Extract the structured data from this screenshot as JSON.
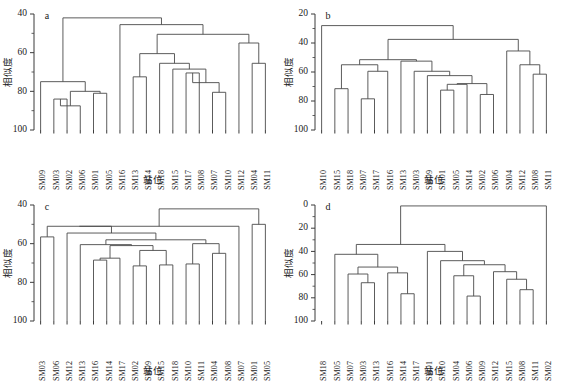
{
  "figure": {
    "width": 561,
    "height": 381,
    "background": "#ffffff",
    "line_color": "#4a4a4a",
    "text_color": "#1a1a1a"
  },
  "axis_titles": {
    "y": "相似度",
    "x": "站位"
  },
  "panels": [
    {
      "tag": "a",
      "y_ticks": [
        40,
        60,
        80,
        100
      ],
      "y_min": 40,
      "y_max": 100,
      "labels": [
        "SM09",
        "SM03",
        "SM02",
        "SM06",
        "SM01",
        "SM05",
        "SM16",
        "SM13",
        "SM14",
        "SM18",
        "SM15",
        "SM17",
        "SM08",
        "SM07",
        "SM10",
        "SM12",
        "SM04",
        "SM11"
      ],
      "merges": [
        {
          "left": 1,
          "right": 2,
          "height": 84.0
        },
        {
          "left": 18,
          "right": 3,
          "height": 87.5
        },
        {
          "left": 4,
          "right": 5,
          "height": 81.0
        },
        {
          "left": 19,
          "right": 20,
          "height": 80.0
        },
        {
          "left": 0,
          "right": 21,
          "height": 75.0
        },
        {
          "left": 11,
          "right": 12,
          "height": 70.5
        },
        {
          "left": 13,
          "right": 14,
          "height": 80.5
        },
        {
          "left": 23,
          "right": 24,
          "height": 75.5
        },
        {
          "left": 10,
          "right": 25,
          "height": 68.5
        },
        {
          "left": 9,
          "right": 26,
          "height": 65.5
        },
        {
          "left": 7,
          "right": 8,
          "height": 72.5
        },
        {
          "left": 28,
          "right": 27,
          "height": 60.5
        },
        {
          "left": 16,
          "right": 17,
          "height": 65.5
        },
        {
          "left": 15,
          "right": 30,
          "height": 55.0
        },
        {
          "left": 29,
          "right": 31,
          "height": 50.5
        },
        {
          "left": 6,
          "right": 32,
          "height": 45.5
        },
        {
          "left": 22,
          "right": 33,
          "height": 42.0
        }
      ]
    },
    {
      "tag": "b",
      "y_ticks": [
        20,
        40,
        60,
        80,
        100
      ],
      "y_min": 20,
      "y_max": 100,
      "labels": [
        "SM10",
        "SM15",
        "SM18",
        "SM07",
        "SM17",
        "SM16",
        "SM13",
        "SM03",
        "SM09",
        "SM01",
        "SM05",
        "SM14",
        "SM02",
        "SM06",
        "SM04",
        "SM12",
        "SM08",
        "SM11"
      ],
      "merges": [
        {
          "left": 1,
          "right": 2,
          "height": 71.5
        },
        {
          "left": 3,
          "right": 4,
          "height": 78.5
        },
        {
          "left": 19,
          "right": 5,
          "height": 59.5
        },
        {
          "left": 18,
          "right": 20,
          "height": 55.0
        },
        {
          "left": 9,
          "right": 10,
          "height": 72.5
        },
        {
          "left": 12,
          "right": 13,
          "height": 75.5
        },
        {
          "left": 22,
          "right": 11,
          "height": 68.5
        },
        {
          "left": 23,
          "right": 24,
          "height": 68.0
        },
        {
          "left": 8,
          "right": 25,
          "height": 62.5
        },
        {
          "left": 7,
          "right": 26,
          "height": 59.5
        },
        {
          "left": 6,
          "right": 27,
          "height": 52.5
        },
        {
          "left": 21,
          "right": 28,
          "height": 51.5
        },
        {
          "left": 16,
          "right": 17,
          "height": 61.5
        },
        {
          "left": 15,
          "right": 30,
          "height": 55.0
        },
        {
          "left": 14,
          "right": 31,
          "height": 45.5
        },
        {
          "left": 29,
          "right": 32,
          "height": 37.5
        },
        {
          "left": 0,
          "right": 33,
          "height": 28.0
        }
      ]
    },
    {
      "tag": "c",
      "y_ticks": [
        40,
        60,
        80,
        100
      ],
      "y_min": 40,
      "y_max": 100,
      "labels": [
        "SM03",
        "SM06",
        "SM12",
        "SM13",
        "SM16",
        "SM14",
        "SM17",
        "SM02",
        "SM09",
        "SM15",
        "SM18",
        "SM10",
        "SM11",
        "SM04",
        "SM08",
        "SM07",
        "SM01",
        "SM05"
      ],
      "merges": [
        {
          "left": 4,
          "right": 5,
          "height": 68.5
        },
        {
          "left": 18,
          "right": 6,
          "height": 67.5
        },
        {
          "left": 7,
          "right": 8,
          "height": 71.5
        },
        {
          "left": 9,
          "right": 10,
          "height": 71.0
        },
        {
          "left": 20,
          "right": 21,
          "height": 63.5
        },
        {
          "left": 19,
          "right": 22,
          "height": 61.0
        },
        {
          "left": 3,
          "right": 23,
          "height": 60.5
        },
        {
          "left": 13,
          "right": 14,
          "height": 65.0
        },
        {
          "left": 11,
          "right": 12,
          "height": 70.5
        },
        {
          "left": 25,
          "right": 26,
          "height": 60.0
        },
        {
          "left": 24,
          "right": 27,
          "height": 58.0
        },
        {
          "left": 2,
          "right": 28,
          "height": 54.5
        },
        {
          "left": 0,
          "right": 1,
          "height": 56.5
        },
        {
          "left": 30,
          "right": 29,
          "height": 51.0
        },
        {
          "left": 31,
          "right": 15,
          "height": 51.0
        },
        {
          "left": 16,
          "right": 17,
          "height": 50.0
        },
        {
          "left": 32,
          "right": 33,
          "height": 42.0
        }
      ]
    },
    {
      "tag": "d",
      "y_ticks": [
        0,
        20,
        40,
        60,
        80,
        100
      ],
      "y_min": 0,
      "y_max": 100,
      "labels": [
        "SM18",
        "SM05",
        "SM07",
        "SM03",
        "SM13",
        "SM16",
        "SM14",
        "SM17",
        "SM01",
        "SM10",
        "SM04",
        "SM06",
        "SM09",
        "SM12",
        "SM15",
        "SM08",
        "SM11",
        "SM02"
      ],
      "merges": [
        {
          "left": 3,
          "right": 4,
          "height": 67.0
        },
        {
          "left": 2,
          "right": 18,
          "height": 59.5
        },
        {
          "left": 6,
          "right": 7,
          "height": 76.5
        },
        {
          "left": 5,
          "right": 20,
          "height": 58.5
        },
        {
          "left": 19,
          "right": 21,
          "height": 53.5
        },
        {
          "left": 1,
          "right": 22,
          "height": 42.5
        },
        {
          "left": 11,
          "right": 12,
          "height": 78.5
        },
        {
          "left": 10,
          "right": 24,
          "height": 61.0
        },
        {
          "left": 15,
          "right": 16,
          "height": 73.0
        },
        {
          "left": 14,
          "right": 26,
          "height": 64.0
        },
        {
          "left": 13,
          "right": 27,
          "height": 57.5
        },
        {
          "left": 25,
          "right": 28,
          "height": 51.5
        },
        {
          "left": 9,
          "right": 29,
          "height": 48.0
        },
        {
          "left": 8,
          "right": 30,
          "height": 40.0
        },
        {
          "left": 23,
          "right": 31,
          "height": 34.0
        },
        {
          "left": 32,
          "right": 17,
          "height": 0.8
        }
      ]
    }
  ]
}
